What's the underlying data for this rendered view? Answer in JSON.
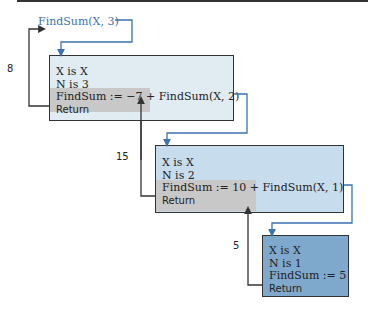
{
  "initial_call": "FindSum(X, 3)",
  "frames": [
    {
      "lines": [
        "X is X",
        "N is 3",
        "FindSum := −7 + FindSum(X, 2)"
      ],
      "return_label": "Return",
      "returned_value": "8"
    },
    {
      "lines": [
        "X is X",
        "N is 2",
        "FindSum := 10 + FindSum(X, 1)"
      ],
      "return_label": "Return",
      "returned_value": "15"
    },
    {
      "lines": [
        "X is X",
        "N is 1",
        "FindSum := 5"
      ],
      "return_label": "Return",
      "returned_value": "5"
    }
  ],
  "colors": {
    "call_arrow": "#3a73b0",
    "return_arrow": "#333333",
    "frame1": "#e1ebf2",
    "frame2": "#c7dcec",
    "frame3": "#7fa9cc",
    "active_shade": "#c8c8c8"
  }
}
